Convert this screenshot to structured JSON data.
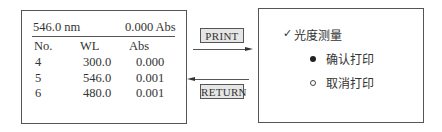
{
  "display": {
    "header": {
      "wavelength": "546.0 nm",
      "absorbance": "0.000 Abs"
    },
    "columns": [
      "No.",
      "WL",
      "Abs"
    ],
    "rows": [
      {
        "no": "4",
        "wl": "300.0",
        "abs": "0.000"
      },
      {
        "no": "5",
        "wl": "546.0",
        "abs": "0.001"
      },
      {
        "no": "6",
        "wl": "480.0",
        "abs": "0.001"
      }
    ]
  },
  "transitions": {
    "print_label": "PRINT",
    "return_label": "RETURN"
  },
  "menu": {
    "title_check": "✓",
    "title": "光度测量",
    "options": [
      {
        "label": "确认打印",
        "selected": true
      },
      {
        "label": "取消打印",
        "selected": false
      }
    ]
  }
}
